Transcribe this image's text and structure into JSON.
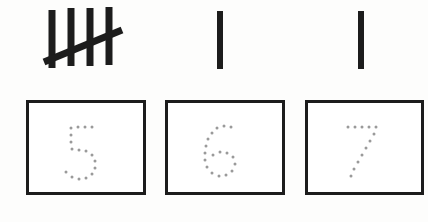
{
  "worksheet": {
    "title": "Tally Marks and Number Tracing Worksheet",
    "background_color": "#fdfdfc",
    "ink_color": "#1c1c1c",
    "trace_dot_color": "#9a9a9a",
    "box_border_color": "#1c1c1c",
    "box_fill_color": "#ffffff"
  },
  "items": [
    {
      "index": 1,
      "tally_count": 5,
      "tally_label": "5",
      "tally_description": "four vertical strokes crossed by a diagonal slash",
      "numeral": "5",
      "numeral_style": "dotted-trace",
      "box": {
        "x": 26,
        "y": 100,
        "width": 120,
        "height": 95
      },
      "tally": {
        "x": 44,
        "y": 8,
        "width": 82,
        "height": 64
      }
    },
    {
      "index": 2,
      "tally_count": 1,
      "tally_label": "1",
      "tally_description": "one vertical stroke",
      "numeral": "6",
      "numeral_style": "dotted-trace",
      "box": {
        "x": 165,
        "y": 100,
        "width": 120,
        "height": 95
      },
      "tally": {
        "x": 214,
        "y": 10,
        "width": 12,
        "height": 60
      }
    },
    {
      "index": 3,
      "tally_count": 1,
      "tally_label": "1",
      "tally_description": "one vertical stroke",
      "numeral": "7",
      "numeral_style": "dotted-trace",
      "box": {
        "x": 305,
        "y": 100,
        "width": 119,
        "height": 95
      },
      "tally": {
        "x": 354,
        "y": 10,
        "width": 12,
        "height": 60
      }
    }
  ],
  "a11y": {
    "tally_group_1": "Tally marks showing five",
    "tally_group_2": "Tally mark showing one",
    "tally_group_3": "Tally mark showing one",
    "trace_box_1": "Tracing box with dotted numeral 5",
    "trace_box_2": "Tracing box with dotted numeral 6",
    "trace_box_3": "Tracing box with dotted numeral 7"
  }
}
